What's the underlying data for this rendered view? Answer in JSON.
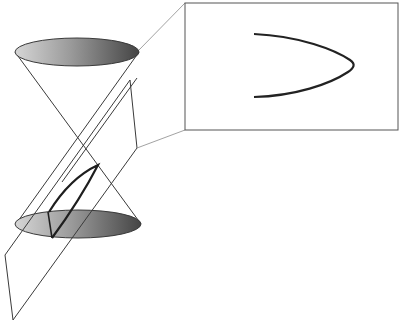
{
  "diagram": {
    "colors": {
      "background": "#ffffff",
      "line": "#3a3a3a",
      "thin_line": "#6a6a6a",
      "curve": "#222222",
      "ellipse_light": "#d2d2d2",
      "ellipse_dark": "#4a4a4a",
      "inset_border": "#555555"
    },
    "cone": {
      "top_ellipse": {
        "cx": 77,
        "cy": 52,
        "rx": 62,
        "ry": 14
      },
      "bottom_ellipse": {
        "cx": 78,
        "cy": 224,
        "rx": 63,
        "ry": 14
      },
      "apex": {
        "x": 78,
        "y": 138
      }
    },
    "plane": {
      "vertices": [
        [
          130,
          80
        ],
        [
          137,
          148
        ],
        [
          13,
          320
        ],
        [
          5,
          255
        ]
      ],
      "inner_edge": [
        [
          137,
          78
        ],
        [
          48,
          200
        ]
      ]
    },
    "inset": {
      "box": {
        "x": 185,
        "y": 3,
        "w": 213,
        "h": 127
      },
      "curve_label": "parabola"
    }
  }
}
